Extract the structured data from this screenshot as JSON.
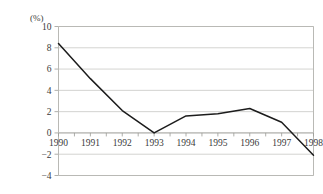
{
  "chart_data": {
    "type": "line",
    "title": "",
    "subtitle": "",
    "xlabel": "",
    "ylabel": "",
    "unit_label": "(%)",
    "categories": [
      "1990",
      "1991",
      "1992",
      "1993",
      "1994",
      "1995",
      "1996",
      "1997",
      "1998"
    ],
    "values": [
      8.4,
      5.1,
      2.1,
      0.0,
      1.6,
      1.8,
      2.3,
      1.0,
      -2.1
    ],
    "series": [
      {
        "name": "",
        "values": [
          8.4,
          5.1,
          2.1,
          0.0,
          1.6,
          1.8,
          2.3,
          1.0,
          -2.1
        ]
      }
    ],
    "ylim": [
      -4,
      10
    ],
    "xlim": [
      "1990",
      "1998"
    ],
    "y_ticks": [
      10,
      8,
      6,
      4,
      2,
      0,
      -2,
      -4
    ],
    "y_tick_labels": [
      "10",
      "8",
      "6",
      "4",
      "2",
      "0",
      "-2",
      "-4"
    ],
    "x_tick_labels": [
      "1990",
      "1991",
      "1992",
      "1993",
      "1994",
      "1995",
      "1996",
      "1997",
      "1998"
    ],
    "grid": true,
    "grid_axis": "y",
    "legend": false,
    "legend_position": "none",
    "line_color": "#1c1c1c",
    "grid_color": "#c8c8c4",
    "axis_color": "#b9b9b5",
    "text_color": "#3a3a3a",
    "background_color": "#ffffff",
    "annotations": [],
    "x_labels_position": "at-zero-line"
  }
}
